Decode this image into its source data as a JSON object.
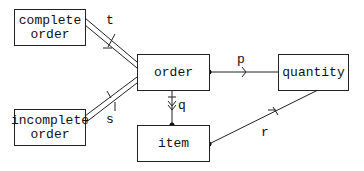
{
  "diagram": {
    "entities": [
      {
        "id": "complete_order",
        "label": "complete\norder"
      },
      {
        "id": "incomplete_order",
        "label": "incomplete\norder"
      },
      {
        "id": "order",
        "label": "order"
      },
      {
        "id": "quantity",
        "label": "quantity"
      },
      {
        "id": "item",
        "label": "item"
      }
    ],
    "relationships": [
      {
        "id": "t",
        "label": "t",
        "from": "complete_order",
        "to": "order"
      },
      {
        "id": "s",
        "label": "s",
        "from": "incomplete_order",
        "to": "order"
      },
      {
        "id": "p",
        "label": "p",
        "from": "order",
        "to": "quantity"
      },
      {
        "id": "q",
        "label": "q",
        "from": "order",
        "to": "item"
      },
      {
        "id": "r",
        "label": "r",
        "from": "item",
        "to": "quantity"
      }
    ],
    "colors": {
      "line": "#222222",
      "background": "#ffffff"
    }
  }
}
